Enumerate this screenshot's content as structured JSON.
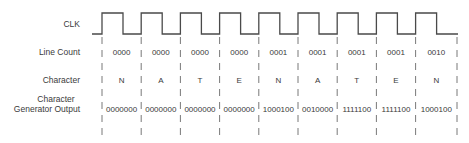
{
  "row_labels": {
    "clk": "CLK",
    "line_count": "Line Count",
    "character": "Character",
    "output_line1": "Character",
    "output_line2": "Generator Output"
  },
  "columns": [
    {
      "line_count": "0000",
      "character": "N",
      "output": "0000000"
    },
    {
      "line_count": "0000",
      "character": "A",
      "output": "0000000"
    },
    {
      "line_count": "0000",
      "character": "T",
      "output": "0000000"
    },
    {
      "line_count": "0000",
      "character": "E",
      "output": "0000000"
    },
    {
      "line_count": "0001",
      "character": "N",
      "output": "1000100"
    },
    {
      "line_count": "0001",
      "character": "A",
      "output": "0010000"
    },
    {
      "line_count": "0001",
      "character": "T",
      "output": "1111100"
    },
    {
      "line_count": "0001",
      "character": "E",
      "output": "1111100"
    },
    {
      "line_count": "0010",
      "character": "N",
      "output": "1000100"
    }
  ],
  "colors": {
    "line": "#4a4a4a",
    "text": "#3a3a3a"
  }
}
